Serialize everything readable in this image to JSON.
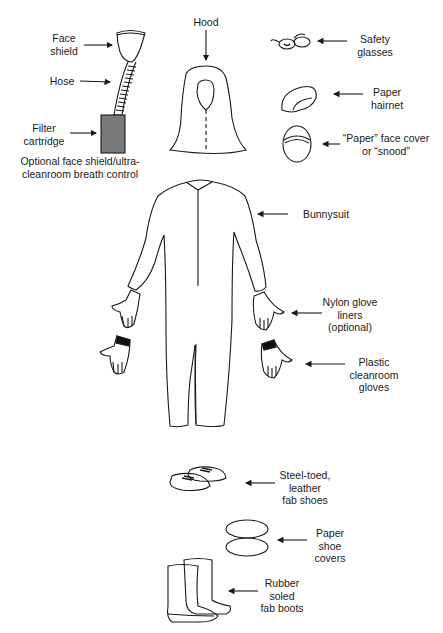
{
  "diagram": {
    "labels": {
      "face_shield": "Face\nshield",
      "hose": "Hose",
      "filter_cartridge": "Filter\ncartridge",
      "breath_control_caption": "Optional face shield/ultra-\ncleanroom breath control",
      "hood": "Hood",
      "safety_glasses": "Safety\nglasses",
      "paper_hairnet": "Paper\nhairnet",
      "face_cover": "“Paper” face cover\nor “snood”",
      "bunnysuit": "Bunnysuit",
      "nylon_glove_liners": "Nylon glove\nliners\n(optional)",
      "plastic_gloves": "Plastic\ncleanroom\ngloves",
      "fab_shoes": "Steel-toed,\nleather\nfab shoes",
      "shoe_covers": "Paper\nshoe\ncovers",
      "fab_boots": "Rubber\nsoled\nfab boots"
    },
    "colors": {
      "line": "#1a1a1a",
      "filter_fill": "#7a7a7a",
      "cuff_fill": "#111111"
    }
  }
}
